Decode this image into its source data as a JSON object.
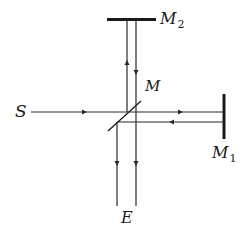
{
  "diagram": {
    "labels": {
      "source": "S",
      "beam_splitter": "M",
      "mirror1": {
        "main": "M",
        "sub": "1"
      },
      "mirror2": {
        "main": "M",
        "sub": "2"
      },
      "eye": "E"
    },
    "elements": [
      {
        "id": "source",
        "label": "S"
      },
      {
        "id": "beam-splitter",
        "label": "M"
      },
      {
        "id": "mirror-1",
        "label": "M1",
        "orientation": "vertical"
      },
      {
        "id": "mirror-2",
        "label": "M2",
        "orientation": "horizontal"
      },
      {
        "id": "observer",
        "label": "E"
      }
    ],
    "colors": {
      "line": "#2a2a2a",
      "background": "#ffffff"
    }
  }
}
